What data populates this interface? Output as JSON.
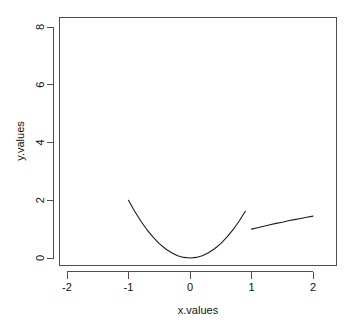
{
  "chart_data": {
    "type": "line",
    "title": "",
    "xlabel": "x.values",
    "ylabel": "y.values",
    "xlim": [
      -2.15,
      2.15
    ],
    "ylim": [
      -0.25,
      8.35
    ],
    "xticks": [
      -2,
      -1,
      0,
      1,
      2
    ],
    "xticklabels": [
      "-2",
      "-1",
      "0",
      "1",
      "2"
    ],
    "yticks": [
      0,
      2,
      4,
      6,
      8
    ],
    "yticklabels": [
      "0",
      "2",
      "4",
      "6",
      "8"
    ],
    "grid": false,
    "legend": false,
    "box": "L-shaped axes with outward ticks",
    "line_color": "#1a1a1a",
    "axis_color": "#4d4d4d",
    "background": "#ffffff",
    "series": [
      {
        "name": "y.values",
        "x": [
          -2.0,
          -1.9,
          -1.8,
          -1.7,
          -1.6,
          -1.5,
          -1.4,
          -1.3,
          -1.2,
          -1.1,
          -1.0,
          -0.9,
          -0.8,
          -0.7,
          -0.6,
          -0.5,
          -0.4,
          -0.3,
          -0.2,
          -0.1,
          0.0,
          0.1,
          0.2,
          0.3,
          0.4,
          0.5,
          0.6,
          0.7,
          0.8,
          0.9,
          1.0,
          1.1,
          1.2,
          1.3,
          1.4,
          1.5,
          1.6,
          1.7,
          1.8,
          1.9,
          2.0
        ],
        "y": [
          8.0,
          7.22,
          6.48,
          5.78,
          5.12,
          4.5,
          3.92,
          3.38,
          2.88,
          2.42,
          2.0,
          1.62,
          1.28,
          0.98,
          0.72,
          0.5,
          0.32,
          0.18,
          0.08,
          0.02,
          0.0,
          0.02,
          0.08,
          0.18,
          0.32,
          0.5,
          0.72,
          0.98,
          1.28,
          1.62,
          1.0,
          1.05,
          1.1,
          1.15,
          1.2,
          1.24,
          1.29,
          1.33,
          1.37,
          1.41,
          1.45
        ]
      }
    ],
    "annotations": {
      "min_point": {
        "x": 0,
        "y": 0
      },
      "left_endpoint": {
        "x": -2,
        "y": 8
      },
      "kink_point": {
        "x": 1,
        "y": 1
      },
      "right_endpoint": {
        "x": 2,
        "y": 1.45
      },
      "description": "Steeply falling parabola-like branch 2x^2 on the left, reaching a minimum near x=0, rising again, with a discontinuous drop/kink at x=1 to y=1 followed by a gently rising branch to y=1.45 at x=2."
    }
  }
}
